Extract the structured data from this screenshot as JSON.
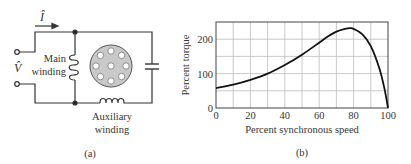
{
  "figure_a": {
    "caption": "(a)",
    "current_label": "Î",
    "voltage_label": "V̂",
    "main_winding_label_line1": "Main",
    "main_winding_label_line2": "winding",
    "aux_winding_label_line1": "Auxiliary",
    "aux_winding_label_line2": "winding"
  },
  "figure_b": {
    "caption": "(b)"
  },
  "chart_data": {
    "type": "line",
    "title": "",
    "xlabel": "Percent synchronous speed",
    "ylabel": "Percent torque",
    "xlim": [
      0,
      100
    ],
    "ylim": [
      0,
      250
    ],
    "x_ticks": [
      0,
      20,
      40,
      60,
      80,
      100
    ],
    "y_ticks": [
      0,
      100,
      200
    ],
    "grid": true,
    "grid_x_step": 10,
    "grid_y_step": 50,
    "legend": null,
    "series": [
      {
        "name": "Torque-speed characteristic",
        "color": "#111111",
        "x": [
          0,
          10,
          20,
          30,
          40,
          50,
          60,
          65,
          70,
          75,
          78,
          80,
          85,
          90,
          95,
          98,
          100
        ],
        "y": [
          58,
          68,
          82,
          100,
          125,
          155,
          190,
          208,
          222,
          230,
          232,
          230,
          215,
          180,
          115,
          55,
          0
        ]
      }
    ]
  }
}
